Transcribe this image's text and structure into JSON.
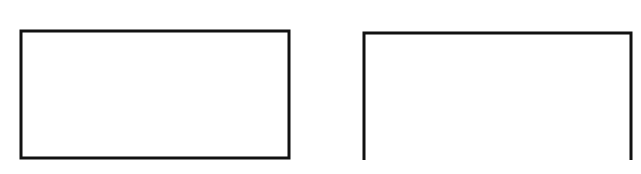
{
  "canvas": {
    "width": 641,
    "height": 174,
    "background": "#ffffff"
  },
  "stroke": {
    "color": "#111111",
    "width": 3
  },
  "shapes": [
    {
      "id": "closed-rectangle",
      "type": "rectangle",
      "closed": true,
      "x": 21,
      "y": 31,
      "width": 268,
      "height": 127
    },
    {
      "id": "open-rectangle",
      "type": "open-bottom-rectangle",
      "closed": false,
      "x": 364,
      "y": 33,
      "width": 267,
      "height": 127
    }
  ]
}
